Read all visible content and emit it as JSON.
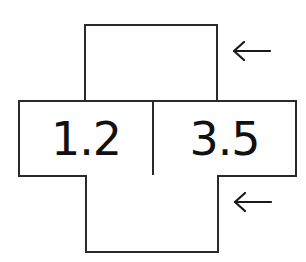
{
  "diagram": {
    "type": "net-of-prism-fragment",
    "cells": [
      {
        "position": "middle-left",
        "value": "1.2"
      },
      {
        "position": "middle-right",
        "value": "3.5"
      }
    ],
    "blank_boxes": [
      "top",
      "bottom"
    ],
    "arrows": [
      {
        "position": "top-right",
        "direction": "left",
        "glyph": "←"
      },
      {
        "position": "bottom-right",
        "direction": "left",
        "glyph": "←"
      }
    ],
    "colors": {
      "line": "#2a2a2a",
      "text": "#111111",
      "background": "#ffffff"
    }
  }
}
